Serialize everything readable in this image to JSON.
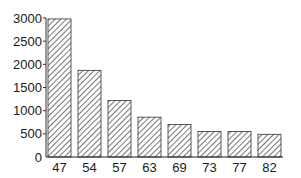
{
  "chart_data": {
    "type": "bar",
    "title": "",
    "xlabel": "",
    "ylabel": "",
    "categories": [
      "47",
      "54",
      "57",
      "63",
      "69",
      "73",
      "77",
      "82"
    ],
    "values": [
      2980,
      1870,
      1220,
      860,
      700,
      550,
      550,
      490
    ],
    "ylim": [
      0,
      3000
    ],
    "yticks": [
      0,
      500,
      1000,
      1500,
      2000,
      2500,
      3000
    ],
    "grid": false,
    "legend": null,
    "bar_style": {
      "fill": "hatched-diagonal",
      "stroke": "#333333"
    }
  },
  "layout": {
    "plot_left": 46,
    "plot_bottom": 157,
    "plot_top": 18,
    "bar_width": 23,
    "bar_step": 30,
    "first_bar_x": 48
  }
}
